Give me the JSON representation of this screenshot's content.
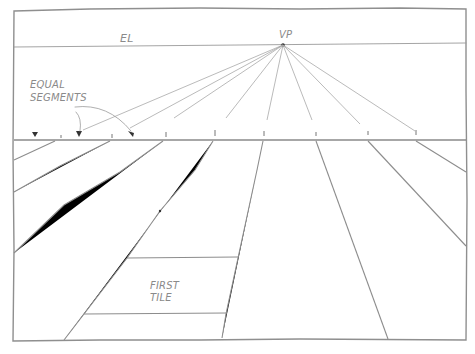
{
  "diagram": {
    "type": "one-point perspective construction",
    "labels": {
      "eye_level": "EL",
      "vanishing_point": "VP",
      "equal_segments_line1": "EQUAL",
      "equal_segments_line2": "SEGMENTS",
      "first_tile_line1": "FIRST",
      "first_tile_line2": "TILE"
    },
    "colors": {
      "background": "#ffffff",
      "pencil": "#9a9a9a",
      "text": "#8a8a8a"
    },
    "frame": {
      "x": 14,
      "y": 10,
      "width": 452,
      "height": 330
    },
    "eye_level_y": 46,
    "ground_line_y": 140,
    "vanishing_point": {
      "x": 283,
      "y": 45
    },
    "ground_ticks_x": [
      61,
      112,
      166,
      215,
      264,
      316,
      368,
      416
    ],
    "arrow_markers_x": [
      35,
      79,
      132
    ],
    "first_tile": {
      "top_y": 257,
      "bottom_y": 314
    }
  }
}
